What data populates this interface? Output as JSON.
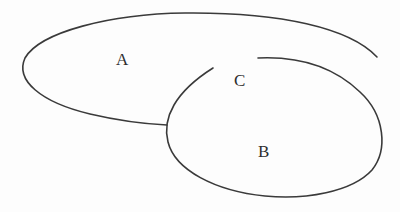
{
  "diagram": {
    "type": "set-diagram",
    "stroke_color": "#3a3a3a",
    "background": "#fdfdfd",
    "labels": {
      "a": "A",
      "b": "B",
      "c": "C"
    },
    "regions": [
      {
        "id": "A",
        "description": "large open curve at top-left"
      },
      {
        "id": "B",
        "description": "ellipse at bottom-right with gap at top"
      },
      {
        "id": "C",
        "description": "region in the gap between A and B"
      }
    ]
  }
}
